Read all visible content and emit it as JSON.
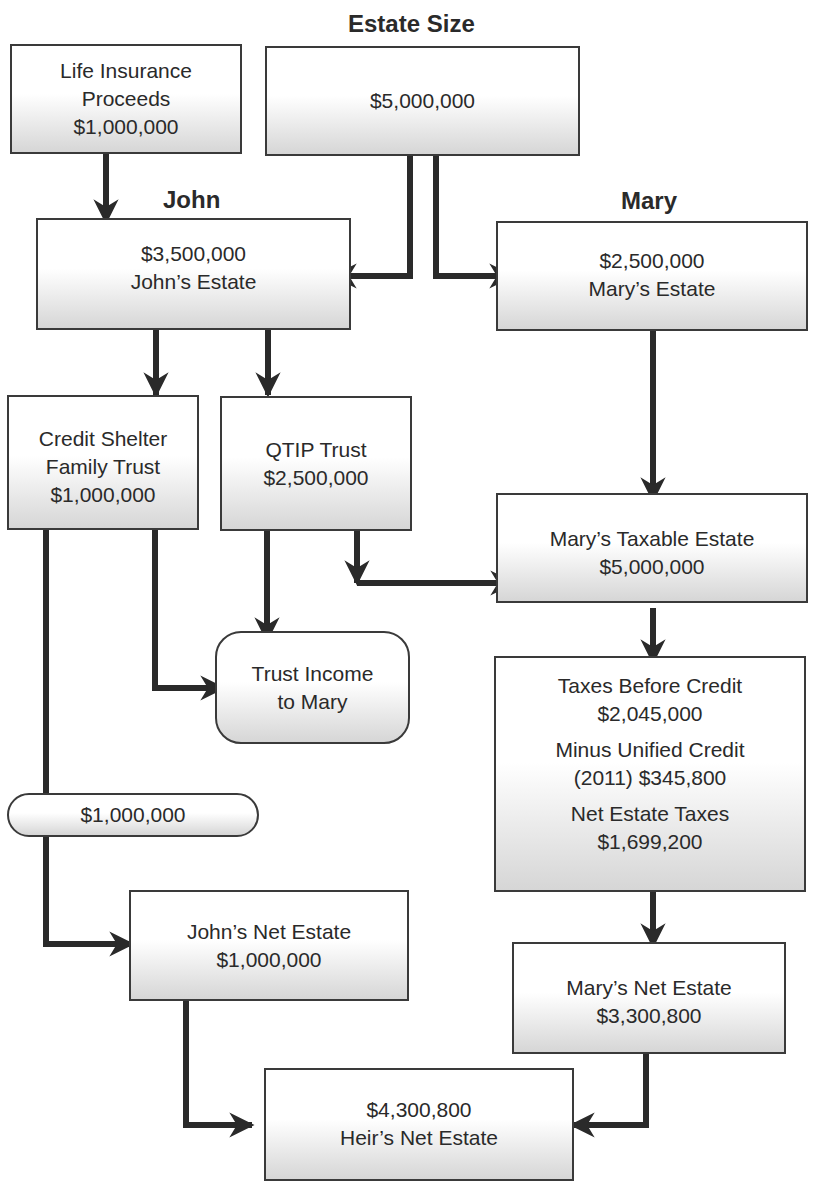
{
  "diagram": {
    "title": "Estate Size",
    "labels": {
      "john": "John",
      "mary": "Mary"
    },
    "nodes": {
      "life_insurance": {
        "line1": "Life Insurance",
        "line2": "Proceeds",
        "line3": "$1,000,000"
      },
      "estate_size": {
        "line1": "$5,000,000"
      },
      "johns_estate": {
        "line1": "$3,500,000",
        "line2": "John’s Estate"
      },
      "marys_estate": {
        "line1": "$2,500,000",
        "line2": "Mary’s Estate"
      },
      "credit_shelter": {
        "line1": "Credit Shelter",
        "line2": "Family Trust",
        "line3": "$1,000,000"
      },
      "qtip_trust": {
        "line1": "QTIP Trust",
        "line2": "$2,500,000"
      },
      "marys_taxable": {
        "line1": "Mary’s Taxable Estate",
        "line2": "$5,000,000"
      },
      "trust_income": {
        "line1": "Trust Income",
        "line2": "to Mary"
      },
      "taxes": {
        "before_label": "Taxes Before Credit",
        "before_value": "$2,045,000",
        "credit_label": "Minus Unified Credit",
        "credit_value": "(2011) $345,800",
        "net_label": "Net Estate Taxes",
        "net_value": "$1,699,200"
      },
      "pill_amount": {
        "line1": "$1,000,000"
      },
      "johns_net": {
        "line1": "John’s Net Estate",
        "line2": "$1,000,000"
      },
      "marys_net": {
        "line1": "Mary’s Net Estate",
        "line2": "$3,300,800"
      },
      "heirs_net": {
        "line1": "$4,300,800",
        "line2": "Heir’s Net Estate"
      }
    },
    "colors": {
      "stroke": "#3a3a3a",
      "arrow": "#2a2a2a",
      "box_gradient_end": "#d6d6d6"
    }
  }
}
